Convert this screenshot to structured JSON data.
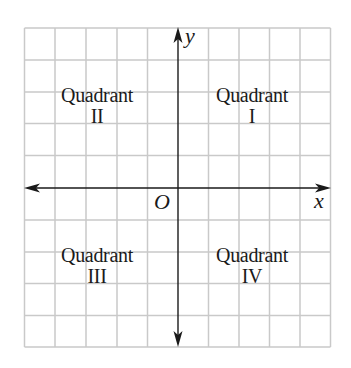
{
  "diagram": {
    "grid": {
      "columns": 10,
      "rows": 10,
      "line_color": "#c9c9c9",
      "axis_color": "#1a1a1a"
    },
    "axes": {
      "x_label": "x",
      "y_label": "y",
      "origin_label": "O"
    },
    "quadrants": [
      {
        "id": "I",
        "name": "Quadrant",
        "numeral": "I"
      },
      {
        "id": "II",
        "name": "Quadrant",
        "numeral": "II"
      },
      {
        "id": "III",
        "name": "Quadrant",
        "numeral": "III"
      },
      {
        "id": "IV",
        "name": "Quadrant",
        "numeral": "IV"
      }
    ]
  }
}
